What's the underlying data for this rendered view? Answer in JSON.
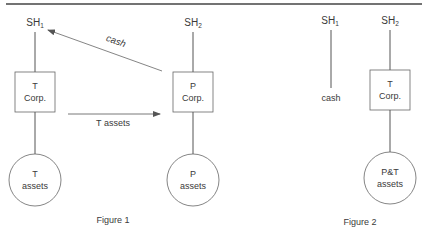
{
  "figure1": {
    "caption": "Figure 1",
    "sh1": {
      "base": "SH",
      "sub": "1"
    },
    "sh2": {
      "base": "SH",
      "sub": "2"
    },
    "t_corp": {
      "line1": "T",
      "line2": "Corp."
    },
    "p_corp": {
      "line1": "P",
      "line2": "Corp."
    },
    "t_assets": {
      "line1": "T",
      "line2": "assets"
    },
    "p_assets": {
      "line1": "P",
      "line2": "assets"
    },
    "cash_arrow_label": "cash",
    "assets_arrow_label": "T assets"
  },
  "figure2": {
    "caption": "Figure 2",
    "sh1": {
      "base": "SH",
      "sub": "1"
    },
    "sh2": {
      "base": "SH",
      "sub": "2"
    },
    "cash_label": "cash",
    "t_corp": {
      "line1": "T",
      "line2": "Corp."
    },
    "pt_assets": {
      "line1": "P&T",
      "line2": "assets"
    }
  },
  "colors": {
    "stroke": "#555555",
    "text": "#3a3a3a",
    "rule": "#444444"
  }
}
